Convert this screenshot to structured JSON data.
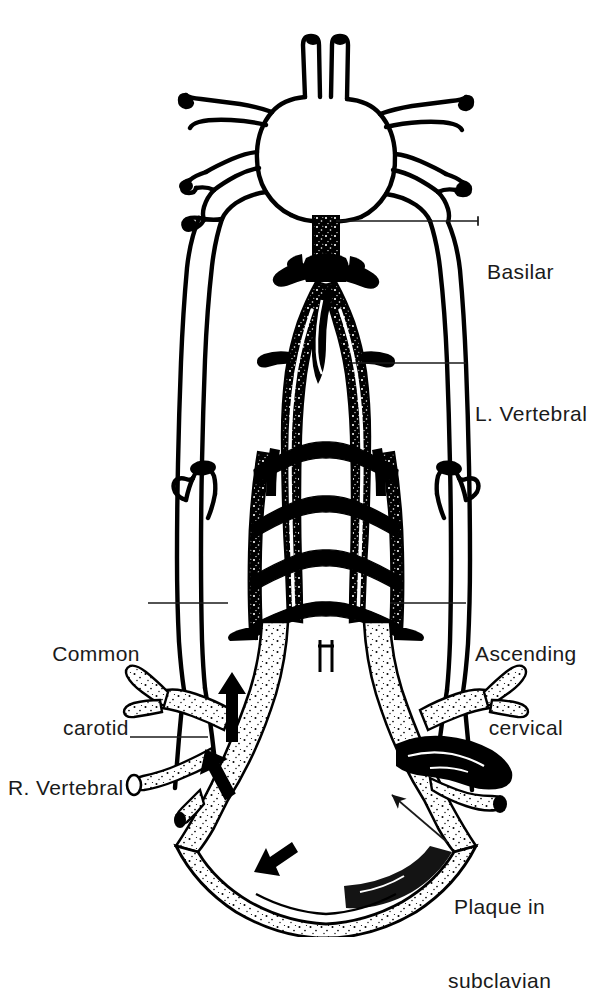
{
  "figure": {
    "kind": "anatomical-line-drawing",
    "background_color": "#ffffff",
    "ink_color": "#000000",
    "label_color": "#1a1a1a"
  },
  "labels": {
    "basilar": {
      "id": "basilar",
      "text": "Basilar",
      "side": "right",
      "lines": [
        "Basilar"
      ],
      "text_x": 487,
      "text_y": 210,
      "leader": {
        "x1": 336,
        "y1": 221,
        "x2": 478,
        "y2": 221,
        "type": "horizontal"
      }
    },
    "left_vertebral": {
      "id": "left-vertebral",
      "text": "L. Vertebral",
      "side": "right",
      "lines": [
        "L. Vertebral"
      ],
      "text_x": 475,
      "text_y": 352,
      "leader": {
        "x1": 352,
        "y1": 363,
        "x2": 466,
        "y2": 363,
        "type": "horizontal"
      }
    },
    "ascending_cervical": {
      "id": "ascending-cervical",
      "text": "Ascending cervical",
      "side": "right",
      "lines": [
        "Ascending",
        "cervical"
      ],
      "text_x": 475,
      "text_y": 592,
      "leader": {
        "x1": 390,
        "y1": 603,
        "x2": 466,
        "y2": 603,
        "type": "horizontal"
      }
    },
    "plaque_in_subclavian": {
      "id": "plaque-in-subclavian",
      "text": "Plaque in subclavian",
      "side": "right",
      "lines": [
        "Plaque in",
        "subclavian"
      ],
      "text_x": 448,
      "text_y": 845,
      "leader": {
        "x1": 392,
        "y1": 795,
        "x2": 447,
        "y2": 842,
        "type": "diagonal-arrow"
      }
    },
    "common_carotid": {
      "id": "common-carotid",
      "text": "Common carotid",
      "side": "left",
      "lines": [
        "Common",
        "carotid"
      ],
      "text_x": 48,
      "text_y": 592,
      "leader": {
        "x1": 148,
        "y1": 603,
        "x2": 228,
        "y2": 603,
        "type": "horizontal"
      }
    },
    "right_vertebral": {
      "id": "right-vertebral",
      "text": "R. Vertebral",
      "side": "left",
      "lines": [
        "R. Vertebral"
      ],
      "text_x": 8,
      "text_y": 726,
      "leader": {
        "x1": 130,
        "y1": 737,
        "x2": 208,
        "y2": 737,
        "type": "horizontal"
      }
    }
  },
  "structures": {
    "circle_of_willis": "circle-of-willis",
    "anterior_cerebral_arteries": "anterior-cerebral-arteries",
    "internal_carotid_left": "left-internal-carotid",
    "internal_carotid_right": "right-internal-carotid",
    "basilar_artery": "basilar-artery",
    "vertebral_artery_left": "left-vertebral-artery",
    "vertebral_artery_right": "right-vertebral-artery",
    "cervical_anastomoses": "cervical-segmental-anastomoses",
    "common_carotid_left": "left-common-carotid-stump",
    "common_carotid_right": "right-common-carotid-stump",
    "subclavian_left": "left-subclavian-artery",
    "subclavian_right": "right-subclavian-artery",
    "aortic_arch": "aortic-arch",
    "plaque": "subclavian-plaque",
    "flow_arrows": "collateral-flow-arrows"
  }
}
